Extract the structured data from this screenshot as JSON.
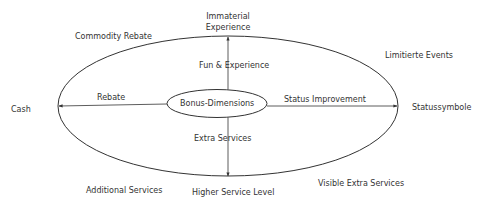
{
  "diagram": {
    "center_node": "Bonus-Dimensions",
    "axes": {
      "up": "Fun & Experience",
      "left": "Rebate",
      "right": "Status Improvement",
      "down": "Extra Services"
    },
    "axis_endpoints": {
      "top_line1": "Immaterial",
      "top_line2": "Experience",
      "left": "Cash",
      "right": "Statussymbole",
      "bottom": "Higher Service Level"
    },
    "quadrant_labels": {
      "top_left": "Commodity Rebate",
      "top_right": "Limitierte Events",
      "bottom_left": "Additional Services",
      "bottom_right": "Visible Extra Services"
    },
    "colors": {
      "line": "#333333",
      "text": "#333333",
      "background": "#ffffff"
    }
  }
}
